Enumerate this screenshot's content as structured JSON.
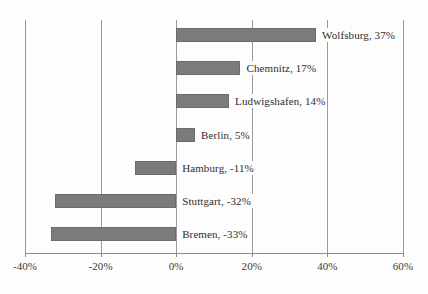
{
  "chart_data": {
    "type": "bar",
    "orientation": "horizontal",
    "title": "",
    "subtitle": "",
    "xlabel": "",
    "ylabel": "",
    "xlim": [
      -40,
      60
    ],
    "grid": true,
    "legend": "none",
    "axis_tick_labels": [
      "-40%",
      "-20%",
      "0%",
      "20%",
      "40%",
      "60%"
    ],
    "axis_tick_values": [
      -40,
      -20,
      0,
      20,
      40,
      60
    ],
    "categories": [
      "Wolfsburg",
      "Chemnitz",
      "Ludwigshafen",
      "Berlin",
      "Hamburg",
      "Stuttgart",
      "Bremen"
    ],
    "values": [
      37,
      17,
      14,
      5,
      -11,
      -32,
      -33
    ],
    "data_labels": [
      "Wolfsburg, 37%",
      "Chemnitz, 17%",
      "Ludwigshafen, 14%",
      "Berlin, 5%",
      "Hamburg, -11%",
      "Stuttgart, -32%",
      "Bremen, -33%"
    ],
    "series": [
      {
        "name": "",
        "values": [
          37,
          17,
          14,
          5,
          -11,
          -32,
          -33
        ]
      }
    ],
    "colors": {
      "bar_fill": "#7b7b7b",
      "bar_border": "#6b6b6b",
      "gridline": "#9a9a9a",
      "axis": "#8e8e8e",
      "text": "#2e2e2e",
      "background": "#fdfdfd"
    }
  }
}
